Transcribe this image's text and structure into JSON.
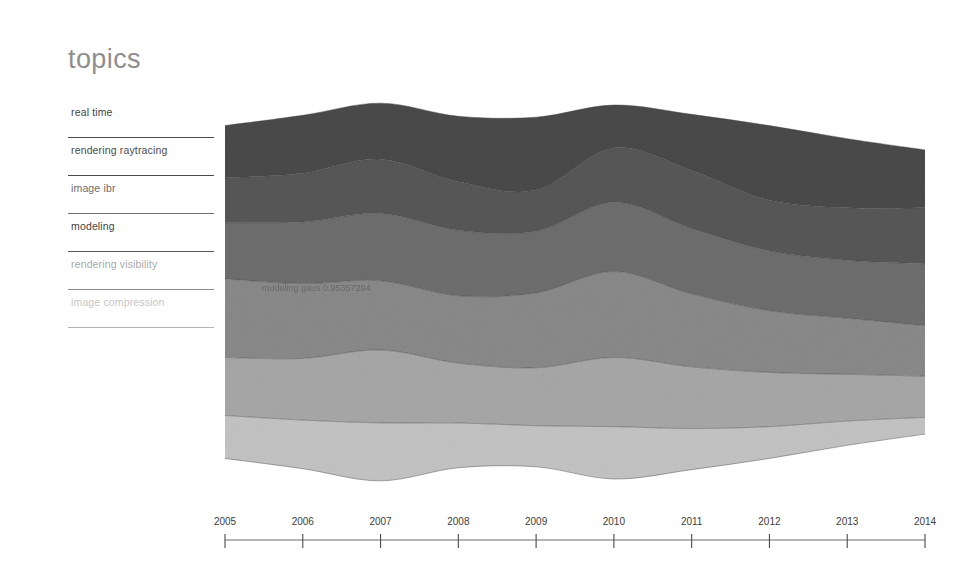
{
  "header": {
    "title": "topics"
  },
  "legend": {
    "items": [
      {
        "label": "real time",
        "color": "#4a4a4a"
      },
      {
        "label": "rendering raytracing",
        "color": "#585858"
      },
      {
        "label": "image ibr",
        "color": "#6e6e6e"
      },
      {
        "label": "modeling",
        "color": "#8a8a8a"
      },
      {
        "label": "rendering visibility",
        "color": "#a8a8a8"
      },
      {
        "label": "image compression",
        "color": "#c4c4c4"
      }
    ]
  },
  "annotation": {
    "text": "modeling  gaus 0.95357294"
  },
  "chart_data": {
    "type": "area",
    "title": "topics",
    "xlabel": "",
    "ylabel": "",
    "grid": false,
    "legend_position": "left",
    "stacking": "streamgraph-wiggle",
    "categories": [
      "2005",
      "2006",
      "2007",
      "2008",
      "2009",
      "2010",
      "2011",
      "2012",
      "2013",
      "2014"
    ],
    "x": [
      2005,
      2006,
      2007,
      2008,
      2009,
      2010,
      2011,
      2012,
      2013,
      2014
    ],
    "xlim": [
      2005,
      2014
    ],
    "annotations": [
      "modeling  gaus 0.95357294"
    ],
    "series": [
      {
        "name": "real time",
        "color": "#4a4a4a",
        "values": [
          56,
          62,
          60,
          70,
          78,
          46,
          60,
          80,
          74,
          62
        ]
      },
      {
        "name": "rendering raytracing",
        "color": "#585858",
        "values": [
          48,
          52,
          58,
          52,
          44,
          58,
          62,
          54,
          56,
          60
        ]
      },
      {
        "name": "image ibr",
        "color": "#6e6e6e",
        "values": [
          60,
          66,
          72,
          70,
          66,
          74,
          70,
          64,
          62,
          66
        ]
      },
      {
        "name": "modeling",
        "color": "#8a8a8a",
        "values": [
          84,
          80,
          74,
          72,
          80,
          92,
          78,
          66,
          60,
          54
        ]
      },
      {
        "name": "rendering visibility",
        "color": "#a8a8a8",
        "values": [
          62,
          66,
          78,
          64,
          62,
          74,
          66,
          58,
          50,
          44
        ]
      },
      {
        "name": "image compression",
        "color": "#c4c4c4",
        "values": [
          46,
          52,
          62,
          48,
          44,
          56,
          44,
          34,
          26,
          18
        ]
      }
    ]
  },
  "axis": {
    "ticks": [
      {
        "label": "2005"
      },
      {
        "label": "2006"
      },
      {
        "label": "2007"
      },
      {
        "label": "2008"
      },
      {
        "label": "2009"
      },
      {
        "label": "2010"
      },
      {
        "label": "2011"
      },
      {
        "label": "2012"
      },
      {
        "label": "2013"
      },
      {
        "label": "2014"
      }
    ]
  }
}
